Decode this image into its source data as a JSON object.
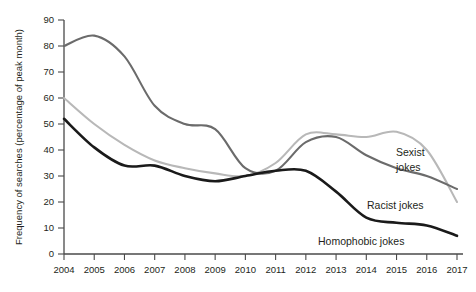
{
  "chart_data": {
    "type": "line",
    "title": "",
    "xlabel": "",
    "ylabel": "Frequency of searches (percentage of peak month)",
    "ylim": [
      0,
      90
    ],
    "yticks": [
      0,
      10,
      20,
      30,
      40,
      50,
      60,
      70,
      80,
      90
    ],
    "grid": false,
    "legend_position": "inline-right",
    "categories": [
      "2004",
      "2005",
      "2006",
      "2007",
      "2008",
      "2009",
      "2010",
      "2011",
      "2012",
      "2013",
      "2014",
      "2015",
      "2016",
      "2017"
    ],
    "x": [
      2004,
      2005,
      2006,
      2007,
      2008,
      2009,
      2010,
      2011,
      2012,
      2013,
      2014,
      2015,
      2016,
      2017
    ],
    "series": [
      {
        "name": "Racist jokes",
        "color": "#6b6b6b",
        "label": "Racist jokes",
        "values": [
          80,
          84,
          76,
          57,
          50,
          48,
          33,
          32,
          43,
          45,
          38,
          33,
          30,
          25
        ]
      },
      {
        "name": "Sexist jokes",
        "color": "#b8b8b8",
        "label": "Sexist jokes",
        "label_line_1": "Sexist",
        "label_line_2": "jokes",
        "values": [
          60,
          50,
          42,
          36,
          33,
          31,
          30,
          35,
          46,
          46,
          45,
          47,
          40,
          20
        ]
      },
      {
        "name": "Homophobic jokes",
        "color": "#1a1a1a",
        "label": "Homophobic jokes",
        "values": [
          52,
          41,
          34,
          34,
          30,
          28,
          30,
          32,
          32,
          24,
          14,
          12,
          11,
          7
        ]
      }
    ],
    "annotations": [
      {
        "text": "Sexist",
        "series": "Sexist jokes"
      },
      {
        "text": "jokes",
        "series": "Sexist jokes"
      },
      {
        "text": "Racist jokes",
        "series": "Racist jokes"
      },
      {
        "text": "Homophobic jokes",
        "series": "Homophobic jokes"
      }
    ]
  },
  "colors": {
    "axis": "#4a4a4a",
    "text": "#231f20",
    "background": "#ffffff",
    "sexist": "#b8b8b8",
    "racist": "#6b6b6b",
    "homophobic": "#1a1a1a"
  }
}
